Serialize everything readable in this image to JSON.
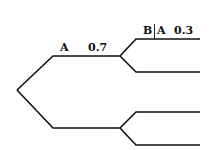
{
  "diagram": {
    "type": "probability-tree",
    "colors": {
      "line": "#111111",
      "background": "#ffffff"
    },
    "root": {
      "x": 17,
      "y": 90
    },
    "level1": [
      {
        "id": "branch-A",
        "event_label": "A",
        "probability": "0.7",
        "path": "M17,90 L53,56 L120,56",
        "label_pos": {
          "event_x": 60,
          "prob_x": 88,
          "y": 51
        }
      },
      {
        "id": "branch-not-A",
        "event_label": "",
        "probability": "",
        "path": "M17,90 L53,128 L120,128"
      }
    ],
    "level2": [
      {
        "id": "branch-B-given-A",
        "parent": "branch-A",
        "event_given": "B",
        "event_condition": "A",
        "probability": "0.3",
        "path": "M120,56 L136,39 L200,39",
        "label_pos": {
          "event_x": 143,
          "prob_x": 174,
          "y": 34
        }
      },
      {
        "id": "branch-notB-given-A",
        "parent": "branch-A",
        "event_label": "",
        "probability": "",
        "path": "M120,56 L136,72 L200,72"
      },
      {
        "id": "branch-B-given-notA",
        "parent": "branch-not-A",
        "event_label": "",
        "probability": "",
        "path": "M120,128 L136,112 L200,112"
      },
      {
        "id": "branch-notB-given-notA",
        "parent": "branch-not-A",
        "event_label": "",
        "probability": "",
        "path": "M120,128 L136,145 L200,145"
      }
    ]
  }
}
